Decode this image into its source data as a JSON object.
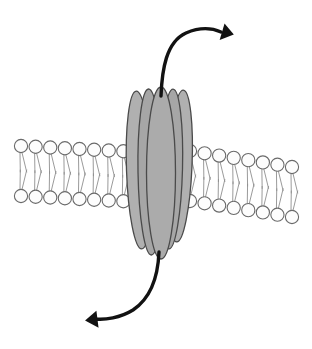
{
  "figure": {
    "caption": "",
    "width": 312,
    "height": 349,
    "background_color": "#ffffff"
  },
  "colors": {
    "background": "#ffffff",
    "protein_fill": "#a8a8a8",
    "protein_fill_light": "#bdbdbd",
    "protein_outline": "#4a4a4a",
    "lipid_head_fill": "#fdfdfd",
    "lipid_head_stroke": "#6a6a6a",
    "lipid_tail_stroke": "#8e8e8e",
    "arrow_color": "#121212"
  },
  "membrane": {
    "name": "phospholipid-bilayer",
    "head_radius": 6.6,
    "leaflets": [
      {
        "name": "upper-leaflet",
        "side": "left",
        "y_start": 146,
        "y_end": 152,
        "x_start": 21,
        "x_end": 138,
        "count": 9
      },
      {
        "name": "lower-leaflet",
        "side": "left",
        "y_start": 196,
        "y_end": 202,
        "x_start": 21,
        "x_end": 138,
        "count": 9
      },
      {
        "name": "upper-leaflet",
        "side": "right",
        "y_start": 151,
        "y_end": 167,
        "x_start": 190,
        "x_end": 292,
        "count": 8
      },
      {
        "name": "lower-leaflet",
        "side": "right",
        "y_start": 201,
        "y_end": 217,
        "x_start": 190,
        "x_end": 292,
        "count": 8
      }
    ]
  },
  "protein": {
    "name": "channel-protein",
    "subunit_count": 5,
    "subunits": [
      {
        "label": "helix-back-left",
        "cx": 139,
        "cy": 170,
        "rx": 12.5,
        "ry": 79,
        "rotate": -2,
        "fill": "#b0b0b0",
        "z": 1
      },
      {
        "label": "helix-back-right",
        "cx": 180,
        "cy": 166,
        "rx": 12.0,
        "ry": 76,
        "rotate": 2.5,
        "fill": "#b0b0b0",
        "z": 1
      },
      {
        "label": "helix-mid-left",
        "cx": 150,
        "cy": 172,
        "rx": 12.0,
        "ry": 83,
        "rotate": -1,
        "fill": "#a6a6a6",
        "z": 2
      },
      {
        "label": "helix-mid-right",
        "cx": 171,
        "cy": 169,
        "rx": 11.5,
        "ry": 80,
        "rotate": 1.5,
        "fill": "#a6a6a6",
        "z": 2
      },
      {
        "label": "helix-front",
        "cx": 161,
        "cy": 173,
        "rx": 14.5,
        "ry": 86,
        "rotate": 0,
        "fill": "#ababab",
        "z": 3
      }
    ]
  },
  "arrows": [
    {
      "name": "efflux-arrow-top",
      "direction": "out-of-cell",
      "path": "M 161 96 C 162 70, 166 42, 186 33 C 200 27, 212 28, 221 32",
      "head_points": "223,24 234,33 221,41",
      "head_rotate": 10
    },
    {
      "name": "influx-arrow-bottom",
      "direction": "into-cell",
      "path": "M 159 252 C 158 276, 151 298, 133 310 C 120 318, 105 320, 95 319",
      "head_points": "97,311 85,320 98,328",
      "head_rotate": -4
    }
  ],
  "labels": {
    "extracellular": "",
    "intracellular": "",
    "protein_name": "",
    "membrane_name": ""
  }
}
